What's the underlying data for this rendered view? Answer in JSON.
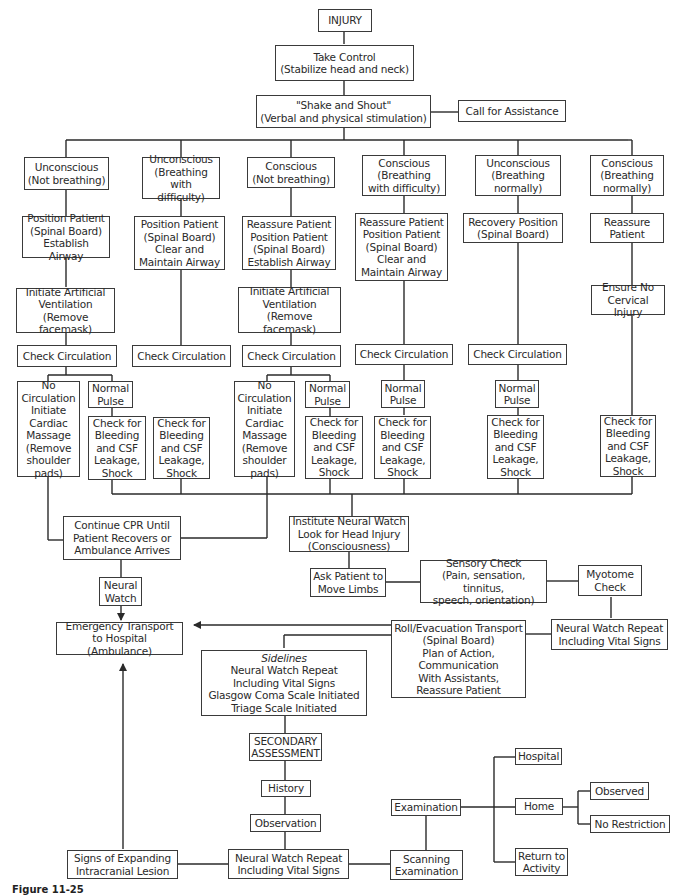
{
  "diagram": {
    "type": "flowchart",
    "caption": "Figure 11-25",
    "nodes": {
      "injury": "INJURY",
      "take_control": "Take Control\n(Stabilize head and neck)",
      "shake_shout": "\"Shake and Shout\"\n(Verbal and physical stimulation)",
      "call_assist": "Call for Assistance",
      "c1_state": "Unconscious\n(Not breathing)",
      "c2_state": "Unconscious\n(Breathing\nwith difficulty)",
      "c3_state": "Conscious\n(Not breathing)",
      "c4_state": "Conscious\n(Breathing\nwith difficulty)",
      "c5_state": "Unconscious\n(Breathing\nnormally)",
      "c6_state": "Conscious\n(Breathing\nnormally)",
      "c1_action": "Position Patient\n(Spinal Board)\nEstablish Airway",
      "c2_action": "Position Patient\n(Spinal Board)\nClear and\nMaintain Airway",
      "c3_action": "Reassure Patient\nPosition Patient\n(Spinal Board)\nEstablish Airway",
      "c4_action": "Reassure Patient\nPosition Patient\n(Spinal Board)\nClear and\nMaintain Airway",
      "c5_action": "Recovery Position\n(Spinal Board)",
      "c6_action": "Reassure\nPatient",
      "c1_vent": "Initiate Artificial\nVentilation\n(Remove facemask)",
      "c3_vent": "Initiate Artificial\nVentilation\n(Remove facemask)",
      "c6_cervical": "Ensure No\nCervical Injury",
      "check_circ": "Check Circulation",
      "no_circ": "No\nCirculation\nInitiate\nCardiac\nMassage\n(Remove\nshoulder\npads)",
      "normal_pulse": "Normal\nPulse",
      "check_bleeding": "Check for\nBleeding\nand CSF\nLeakage,\nShock",
      "continue_cpr": "Continue CPR Until\nPatient Recovers or\nAmbulance Arrives",
      "neural_watch": "Neural\nWatch",
      "institute_neural": "Institute Neural Watch\nLook for Head Injury\n(Consciousness)",
      "ask_patient": "Ask Patient to\nMove Limbs",
      "sensory_check": "Sensory Check\n(Pain, sensation, tinnitus,\nspeech, orientation)",
      "myotome": "Myotome\nCheck",
      "emergency_transport": "Emergency Transport\nto Hospital (Ambulance)",
      "roll_evac": "Roll/Evacuation Transport\n(Spinal Board)\nPlan of Action,\nCommunication\nWith Assistants,\nReassure Patient",
      "nw_repeat_right": "Neural Watch Repeat\nIncluding Vital Signs",
      "sidelines_title": "Sidelines",
      "sidelines_body": "Neural Watch Repeat\nIncluding Vital Signs\nGlasgow Coma Scale Initiated\nTriage Scale Initiated",
      "secondary": "SECONDARY\nASSESSMENT",
      "history": "History",
      "observation": "Observation",
      "nw_repeat_bottom": "Neural Watch Repeat\nIncluding Vital Signs",
      "signs_expanding": "Signs of Expanding\nIntracranial Lesion",
      "scanning": "Scanning\nExamination",
      "examination": "Examination",
      "hospital": "Hospital",
      "home": "Home",
      "observed": "Observed",
      "no_restriction": "No Restriction",
      "return_activity": "Return to\nActivity"
    }
  }
}
